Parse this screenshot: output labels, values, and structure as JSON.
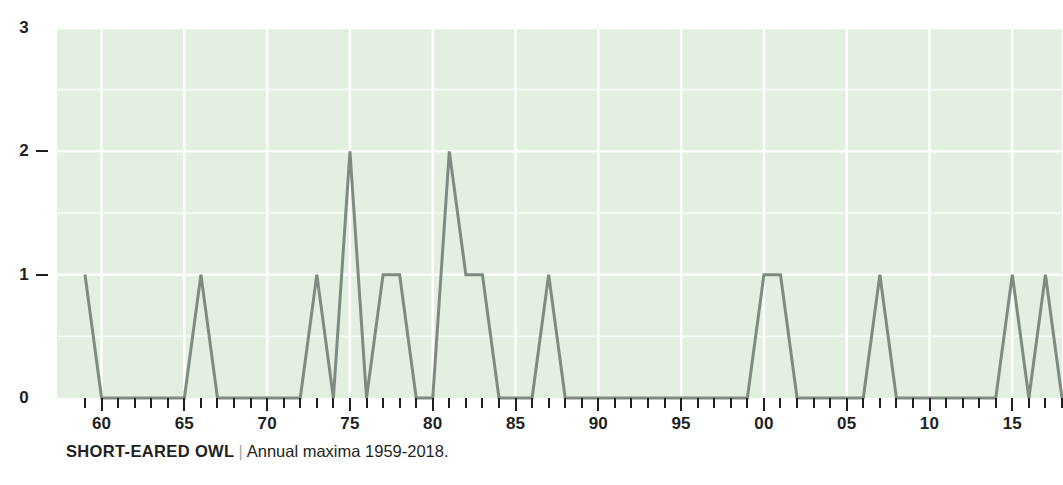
{
  "caption": {
    "species": "SHORT-EARED OWL",
    "separator": "|",
    "description": "Annual maxima 1959-2018."
  },
  "colors": {
    "plot_background": "#e2efe1",
    "gridline": "#ffffff",
    "series_line": "#7e8b80",
    "axis_text": "#221f1f",
    "page_background": "#ffffff"
  },
  "axes": {
    "y_ticks": [
      0,
      1,
      2,
      3
    ],
    "y_tick_labels": [
      "0",
      "1",
      "2",
      "3"
    ],
    "x_tick_labels": [
      "60",
      "65",
      "70",
      "75",
      "80",
      "85",
      "90",
      "95",
      "00",
      "05",
      "10",
      "15"
    ],
    "x_tick_years": [
      1960,
      1965,
      1970,
      1975,
      1980,
      1985,
      1990,
      1995,
      2000,
      2005,
      2010,
      2015
    ]
  },
  "chart_data": {
    "type": "line",
    "title": "SHORT-EARED OWL",
    "subtitle": "Annual maxima 1959-2018.",
    "xlabel": "",
    "ylabel": "",
    "xlim": [
      1959,
      2018
    ],
    "ylim": [
      0,
      3
    ],
    "grid": true,
    "legend": "none",
    "x": [
      1959,
      1960,
      1961,
      1962,
      1963,
      1964,
      1965,
      1966,
      1967,
      1968,
      1969,
      1970,
      1971,
      1972,
      1973,
      1974,
      1975,
      1976,
      1977,
      1978,
      1979,
      1980,
      1981,
      1982,
      1983,
      1984,
      1985,
      1986,
      1987,
      1988,
      1989,
      1990,
      1991,
      1992,
      1993,
      1994,
      1995,
      1996,
      1997,
      1998,
      1999,
      2000,
      2001,
      2002,
      2003,
      2004,
      2005,
      2006,
      2007,
      2008,
      2009,
      2010,
      2011,
      2012,
      2013,
      2014,
      2015,
      2016,
      2017,
      2018
    ],
    "values": [
      1,
      0,
      0,
      0,
      0,
      0,
      0,
      1,
      0,
      0,
      0,
      0,
      0,
      0,
      1,
      0,
      2,
      0,
      1,
      1,
      0,
      0,
      2,
      1,
      1,
      0,
      0,
      0,
      1,
      0,
      0,
      0,
      0,
      0,
      0,
      0,
      0,
      0,
      0,
      0,
      0,
      1,
      1,
      0,
      0,
      0,
      0,
      0,
      1,
      0,
      0,
      0,
      0,
      0,
      0,
      0,
      1,
      0,
      1,
      0
    ],
    "series": [
      {
        "name": "Annual maxima",
        "values": [
          1,
          0,
          0,
          0,
          0,
          0,
          0,
          1,
          0,
          0,
          0,
          0,
          0,
          0,
          1,
          0,
          2,
          0,
          1,
          1,
          0,
          0,
          2,
          1,
          1,
          0,
          0,
          0,
          1,
          0,
          0,
          0,
          0,
          0,
          0,
          0,
          0,
          0,
          0,
          0,
          0,
          1,
          1,
          0,
          0,
          0,
          0,
          0,
          1,
          0,
          0,
          0,
          0,
          0,
          0,
          0,
          1,
          0,
          1,
          0
        ]
      }
    ]
  }
}
